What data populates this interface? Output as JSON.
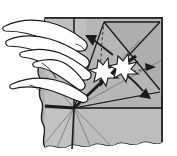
{
  "figure": {
    "caption": "",
    "background_color": "#ffffff",
    "paper_fill": "#b3b3b3",
    "paper_fill_light": "#c9c9c9",
    "paper_fill_dark": "#9a9a9a",
    "ink_color": "#1a1a1a",
    "hand_fill": "#ffffff",
    "burst_fill": "#ffffff"
  },
  "paper": {
    "name": "folded-square-sheet",
    "description": "Square sheet of paper seen from above with radiating crease lines",
    "edges": {
      "top": "straight",
      "right": "straight",
      "bottom": "torn-wavy",
      "left": "torn-wavy"
    },
    "center_point": {
      "x": 74,
      "y": 108
    }
  },
  "creases": {
    "name": "crease-lines",
    "count": 12,
    "type": "radiating-fan",
    "note": "Thin grey fold lines fanning out from the lower-left center point"
  },
  "hands": [
    {
      "name": "upper-hand",
      "label": "Upper hand holding flap",
      "finger_count": 3,
      "position": "left-upper"
    },
    {
      "name": "lower-hand",
      "label": "Lower hand pressing center",
      "finger_count": 2,
      "position": "left-lower"
    }
  ],
  "symbols": [
    {
      "name": "burst-symbol-left",
      "type": "starburst",
      "meaning": "push/pop here",
      "points": 7
    },
    {
      "name": "burst-symbol-right",
      "type": "starburst",
      "meaning": "push/pop here",
      "points": 7
    }
  ],
  "arrows": [
    {
      "name": "fold-arrow-up-left",
      "style": "solid",
      "direction": "up-left",
      "meaning": "fold flap this way"
    },
    {
      "name": "fold-arrow-down-right",
      "style": "solid",
      "direction": "down-right",
      "meaning": "fold flap this way"
    },
    {
      "name": "guide-arrow-right",
      "style": "dashed",
      "direction": "right",
      "meaning": "hidden / behind movement"
    },
    {
      "name": "guide-line-up",
      "style": "dashed",
      "direction": "up",
      "meaning": "reference crease"
    }
  ]
}
